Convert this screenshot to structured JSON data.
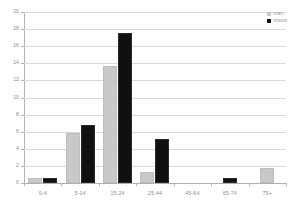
{
  "chart_data": {
    "type": "bar",
    "title": "",
    "xlabel": "",
    "ylabel": "",
    "categories": [
      "0-4",
      "5-14",
      "15-24",
      "25-44",
      "45-64",
      "65-74",
      "75+"
    ],
    "series": [
      {
        "name": "man",
        "color": "#c9c9c9",
        "values": [
          0.3,
          5.6,
          13.4,
          1.0,
          0,
          0,
          1.5
        ]
      },
      {
        "name": "vrouw",
        "color": "#101010",
        "values": [
          0.35,
          6.6,
          17.3,
          4.9,
          0,
          0.4,
          0
        ]
      }
    ],
    "ylim": [
      0,
      20
    ],
    "yticks": [
      0,
      2,
      4,
      6,
      8,
      10,
      12,
      14,
      16,
      18,
      20
    ],
    "grid": true,
    "legend_position": "top-right"
  },
  "legend": {
    "items": [
      {
        "label": "man"
      },
      {
        "label": "vrouw"
      }
    ]
  }
}
